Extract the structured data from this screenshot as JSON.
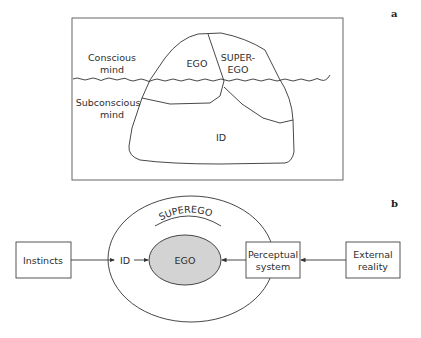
{
  "panels": {
    "a": {
      "label": "a",
      "regions": {
        "conscious_line1": "Conscious",
        "conscious_line2": "mind",
        "subconscious_line1": "Subconscious",
        "subconscious_line2": "mind"
      },
      "iceberg": {
        "ego": "EGO",
        "superego_line1": "SUPER-",
        "superego_line2": "EGO",
        "id": "ID"
      }
    },
    "b": {
      "label": "b",
      "superego": "SUPEREGO",
      "id": "ID",
      "ego": "EGO",
      "boxes": {
        "instincts": "Instincts",
        "perceptual_line1": "Perceptual",
        "perceptual_line2": "system",
        "external_line1": "External",
        "external_line2": "reality"
      }
    }
  },
  "colors": {
    "line": "#3a3a3a",
    "ego_fill": "#d3d3d3",
    "frame": "#555555"
  }
}
